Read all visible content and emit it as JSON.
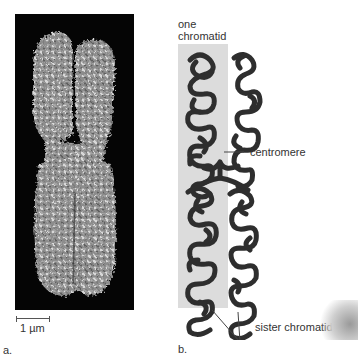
{
  "figure": {
    "panel_a": {
      "label": "a.",
      "scale_bar": "1 µm",
      "description": "scanning electron micrograph of a duplicated chromosome"
    },
    "panel_b": {
      "label": "b.",
      "labels": {
        "one_chromatid_line1": "one",
        "one_chromatid_line2": "chromatid",
        "centromere": "centromere",
        "sister_chromatids": "sister chromatids"
      },
      "colors": {
        "chromatin": "#3a3a3a",
        "highlight_band": "#dcdcdc"
      }
    }
  }
}
